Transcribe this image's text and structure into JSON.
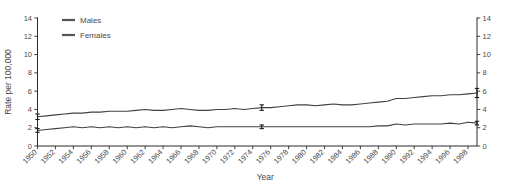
{
  "chart_data": {
    "type": "line",
    "title": "",
    "xlabel": "Year",
    "ylabel": "Rate per 100,000",
    "xlim": [
      1950,
      1999
    ],
    "ylim": [
      0,
      14
    ],
    "yticks": [
      0,
      2,
      4,
      6,
      8,
      10,
      12,
      14
    ],
    "ytick_labels": [
      "0",
      "2",
      "4",
      "6",
      "8",
      "10",
      "12",
      "14"
    ],
    "right_axis": true,
    "right_ytick_labels": [
      "0",
      "2",
      "4",
      "6",
      "8",
      "10",
      "12",
      "14"
    ],
    "grid": false,
    "legend_position": "top-left",
    "xticks": [
      1950,
      1952,
      1954,
      1956,
      1958,
      1960,
      1962,
      1964,
      1966,
      1968,
      1970,
      1972,
      1974,
      1976,
      1978,
      1980,
      1982,
      1984,
      1986,
      1988,
      1990,
      1992,
      1994,
      1996,
      1998
    ],
    "xtick_labels": [
      "1950",
      "1952",
      "1954",
      "1956",
      "1958",
      "1960",
      "1962",
      "1964",
      "1966",
      "1968",
      "1970",
      "1972",
      "1974",
      "1976",
      "1978",
      "1980",
      "1982",
      "1984",
      "1986",
      "1988",
      "1990",
      "1992",
      "1994",
      "1996",
      "1998"
    ],
    "x": [
      1950,
      1951,
      1952,
      1953,
      1954,
      1955,
      1956,
      1957,
      1958,
      1959,
      1960,
      1961,
      1962,
      1963,
      1964,
      1965,
      1966,
      1967,
      1968,
      1969,
      1970,
      1971,
      1972,
      1973,
      1974,
      1975,
      1976,
      1977,
      1978,
      1979,
      1980,
      1981,
      1982,
      1983,
      1984,
      1985,
      1986,
      1987,
      1988,
      1989,
      1990,
      1991,
      1992,
      1993,
      1994,
      1995,
      1996,
      1997,
      1998,
      1999
    ],
    "series": [
      {
        "name": "Males",
        "color": "#404040",
        "values": [
          3.2,
          3.3,
          3.4,
          3.5,
          3.6,
          3.6,
          3.7,
          3.7,
          3.8,
          3.8,
          3.8,
          3.9,
          4.0,
          3.9,
          3.9,
          4.0,
          4.1,
          4.0,
          3.9,
          3.9,
          4.0,
          4.0,
          4.1,
          4.0,
          4.1,
          4.2,
          4.2,
          4.3,
          4.4,
          4.5,
          4.5,
          4.4,
          4.5,
          4.6,
          4.5,
          4.5,
          4.6,
          4.7,
          4.8,
          4.9,
          5.2,
          5.2,
          5.3,
          5.4,
          5.5,
          5.5,
          5.6,
          5.6,
          5.7,
          5.8
        ],
        "error_bars": [
          {
            "x": 1950,
            "y": 3.2,
            "low": 2.9,
            "high": 3.5
          },
          {
            "x": 1975,
            "y": 4.2,
            "low": 3.9,
            "high": 4.5
          },
          {
            "x": 1999,
            "y": 5.8,
            "low": 5.3,
            "high": 6.3
          }
        ]
      },
      {
        "name": "Females",
        "color": "#404040",
        "values": [
          1.7,
          1.8,
          1.9,
          2.0,
          2.1,
          2.0,
          2.1,
          2.0,
          2.1,
          2.0,
          2.1,
          2.0,
          2.1,
          2.0,
          2.1,
          2.0,
          2.1,
          2.2,
          2.1,
          2.0,
          2.1,
          2.1,
          2.1,
          2.1,
          2.1,
          2.1,
          2.1,
          2.1,
          2.1,
          2.1,
          2.1,
          2.1,
          2.1,
          2.1,
          2.1,
          2.1,
          2.1,
          2.1,
          2.2,
          2.2,
          2.4,
          2.3,
          2.4,
          2.4,
          2.4,
          2.4,
          2.5,
          2.4,
          2.6,
          2.5
        ],
        "error_bars": [
          {
            "x": 1950,
            "y": 1.7,
            "low": 1.5,
            "high": 1.9
          },
          {
            "x": 1975,
            "y": 2.1,
            "low": 1.9,
            "high": 2.3
          },
          {
            "x": 1999,
            "y": 2.5,
            "low": 2.3,
            "high": 2.7
          }
        ]
      }
    ],
    "legend": [
      {
        "label": "Males"
      },
      {
        "label": "Females"
      }
    ]
  }
}
